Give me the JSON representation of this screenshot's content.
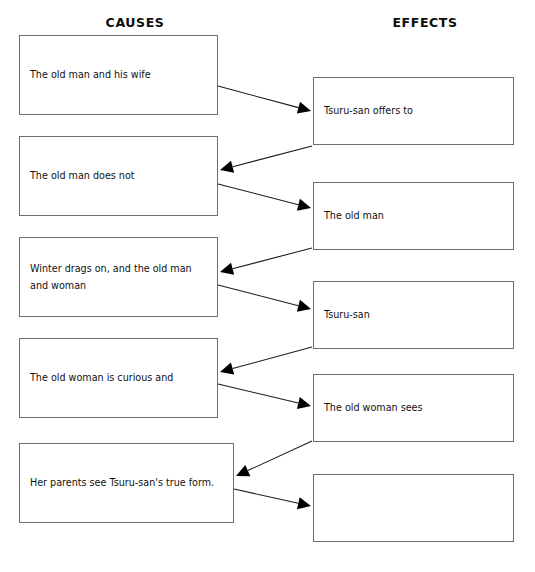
{
  "page": {
    "width": 535,
    "height": 572,
    "background": "#ffffff",
    "top_artifact_text": "· · ·",
    "border_color": "#6e6e6e",
    "arrow_color": "#000000",
    "text_color": "#111111"
  },
  "headers": {
    "causes": "CAUSES",
    "effects": "EFFECTS"
  },
  "causes": [
    {
      "id": "cause-1",
      "text": "The old man and his wife",
      "x": 19,
      "y": 35,
      "w": 199,
      "h": 80
    },
    {
      "id": "cause-2",
      "text": "The old man does not",
      "x": 19,
      "y": 136,
      "w": 199,
      "h": 80
    },
    {
      "id": "cause-3",
      "text": "Winter drags on, and the old man\nand woman",
      "x": 19,
      "y": 237,
      "w": 199,
      "h": 80
    },
    {
      "id": "cause-4",
      "text": "The old woman is curious and",
      "x": 19,
      "y": 338,
      "w": 199,
      "h": 80
    },
    {
      "id": "cause-5",
      "text": "Her parents see Tsuru-san's true form.",
      "x": 19,
      "y": 443,
      "w": 215,
      "h": 80
    }
  ],
  "effects": [
    {
      "id": "effect-1",
      "text": "Tsuru-san offers to",
      "x": 313,
      "y": 77,
      "w": 201,
      "h": 68
    },
    {
      "id": "effect-2",
      "text": "The old man",
      "x": 313,
      "y": 182,
      "w": 201,
      "h": 68
    },
    {
      "id": "effect-3",
      "text": "Tsuru-san",
      "x": 313,
      "y": 281,
      "w": 201,
      "h": 68
    },
    {
      "id": "effect-4",
      "text": "The old woman sees",
      "x": 313,
      "y": 374,
      "w": 201,
      "h": 68
    },
    {
      "id": "effect-5",
      "text": "",
      "x": 313,
      "y": 474,
      "w": 201,
      "h": 68
    }
  ],
  "connectors": [
    {
      "id": "conn-c1-e1",
      "from": "cause-1",
      "to": "effect-1",
      "direction": "right",
      "x1": 218,
      "y1": 86,
      "x2": 311,
      "y2": 111
    },
    {
      "id": "conn-e1-c2",
      "from": "effect-1",
      "to": "cause-2",
      "direction": "left",
      "x1": 312,
      "y1": 146,
      "x2": 220,
      "y2": 170
    },
    {
      "id": "conn-c2-e2",
      "from": "cause-2",
      "to": "effect-2",
      "direction": "right",
      "x1": 218,
      "y1": 184,
      "x2": 311,
      "y2": 208
    },
    {
      "id": "conn-e2-c3",
      "from": "effect-2",
      "to": "cause-3",
      "direction": "left",
      "x1": 312,
      "y1": 248,
      "x2": 220,
      "y2": 272
    },
    {
      "id": "conn-c3-e3",
      "from": "cause-3",
      "to": "effect-3",
      "direction": "right",
      "x1": 218,
      "y1": 285,
      "x2": 311,
      "y2": 309
    },
    {
      "id": "conn-e3-c4",
      "from": "effect-3",
      "to": "cause-4",
      "direction": "left",
      "x1": 312,
      "y1": 347,
      "x2": 220,
      "y2": 372
    },
    {
      "id": "conn-c4-e4",
      "from": "cause-4",
      "to": "effect-4",
      "direction": "right",
      "x1": 218,
      "y1": 384,
      "x2": 311,
      "y2": 406
    },
    {
      "id": "conn-e4-c5",
      "from": "effect-4",
      "to": "cause-5",
      "direction": "left",
      "x1": 312,
      "y1": 441,
      "x2": 236,
      "y2": 476
    },
    {
      "id": "conn-c5-e5",
      "from": "cause-5",
      "to": "effect-5",
      "direction": "right",
      "x1": 234,
      "y1": 489,
      "x2": 311,
      "y2": 506
    }
  ]
}
